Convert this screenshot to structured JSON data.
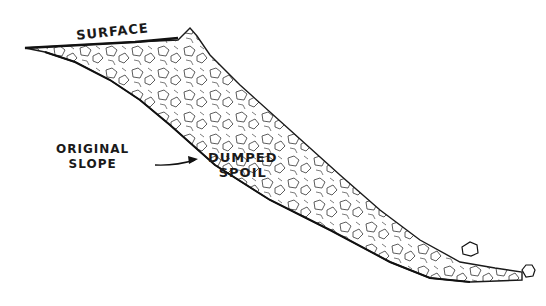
{
  "diagram": {
    "labels": {
      "surface": "SURFACE",
      "original_slope_line1": "ORIGINAL",
      "original_slope_line2": "SLOPE",
      "dumped_spoil_line1": "DUMPED",
      "dumped_spoil_line2": "SPOIL"
    },
    "colors": {
      "ink": "#1a1a1a",
      "background": "#ffffff"
    }
  }
}
